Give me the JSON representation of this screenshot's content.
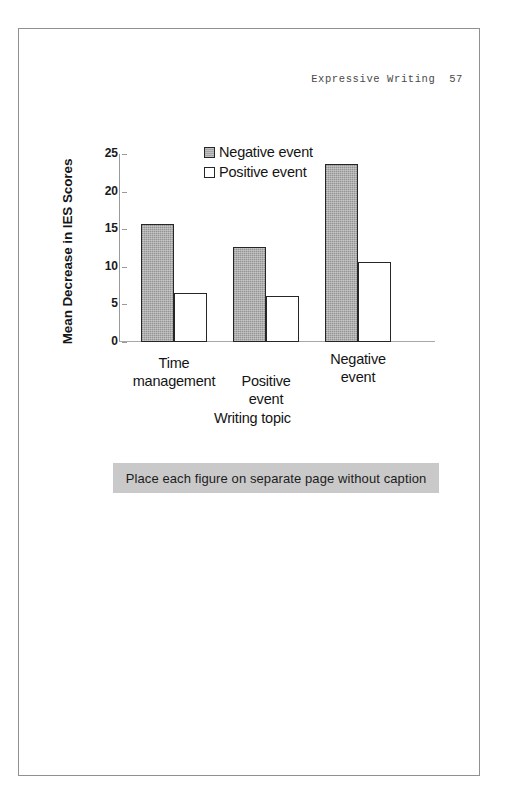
{
  "page": {
    "running_head": "Expressive Writing  57",
    "border_color": "#8e9094"
  },
  "annotation": {
    "text": "Place each figure on separate page without caption",
    "background": "#c9c9c9"
  },
  "chart_data": {
    "type": "bar",
    "title": "",
    "xlabel": "Writing topic",
    "ylabel": "Mean Decrease in IES Scores",
    "categories": [
      "Time management",
      "Positive event",
      "Negative event"
    ],
    "category_lines": [
      [
        "Time",
        "management"
      ],
      [
        "Positive",
        "event"
      ],
      [
        "Negative",
        "event"
      ]
    ],
    "series": [
      {
        "name": "Negative event",
        "color": "#a5a5a5",
        "values": [
          15.7,
          12.7,
          23.7
        ]
      },
      {
        "name": "Positive event",
        "color": "#ffffff",
        "values": [
          6.5,
          6.1,
          10.7
        ]
      }
    ],
    "ylim": [
      0,
      25
    ],
    "yticks": [
      0,
      5,
      10,
      15,
      20,
      25
    ],
    "ytick_labels": [
      "0",
      "5",
      "10",
      "15",
      "20",
      "25"
    ],
    "grid": false,
    "legend_position": "top-center"
  }
}
